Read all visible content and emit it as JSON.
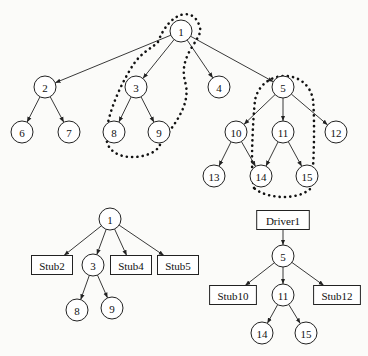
{
  "diagram": {
    "top_tree": {
      "nodes": [
        {
          "id": "1",
          "label": "1",
          "x": 181,
          "y": 31
        },
        {
          "id": "2",
          "label": "2",
          "x": 45,
          "y": 87
        },
        {
          "id": "3",
          "label": "3",
          "x": 136,
          "y": 87
        },
        {
          "id": "4",
          "label": "4",
          "x": 219,
          "y": 87
        },
        {
          "id": "5",
          "label": "5",
          "x": 283,
          "y": 87
        },
        {
          "id": "6",
          "label": "6",
          "x": 22,
          "y": 132
        },
        {
          "id": "7",
          "label": "7",
          "x": 69,
          "y": 132
        },
        {
          "id": "8",
          "label": "8",
          "x": 114,
          "y": 132
        },
        {
          "id": "9",
          "label": "9",
          "x": 159,
          "y": 132
        },
        {
          "id": "10",
          "label": "10",
          "x": 236,
          "y": 132
        },
        {
          "id": "11",
          "label": "11",
          "x": 283,
          "y": 132
        },
        {
          "id": "12",
          "label": "12",
          "x": 336,
          "y": 132
        },
        {
          "id": "13",
          "label": "13",
          "x": 214,
          "y": 176
        },
        {
          "id": "14",
          "label": "14",
          "x": 261,
          "y": 176
        },
        {
          "id": "15",
          "label": "15",
          "x": 307,
          "y": 176
        }
      ],
      "edges": [
        [
          "1",
          "2"
        ],
        [
          "1",
          "3"
        ],
        [
          "1",
          "4"
        ],
        [
          "1",
          "5"
        ],
        [
          "2",
          "6"
        ],
        [
          "2",
          "7"
        ],
        [
          "3",
          "8"
        ],
        [
          "3",
          "9"
        ],
        [
          "5",
          "10"
        ],
        [
          "5",
          "11"
        ],
        [
          "5",
          "12"
        ],
        [
          "10",
          "13"
        ],
        [
          "10",
          "14"
        ],
        [
          "11",
          "14"
        ],
        [
          "11",
          "15"
        ]
      ],
      "dotted_groups": [
        {
          "name": "group-1-3-8-9",
          "members": [
            "1",
            "3",
            "8",
            "9"
          ]
        },
        {
          "name": "group-5-11-14-15",
          "members": [
            "5",
            "11",
            "14",
            "15"
          ]
        }
      ]
    },
    "left_subtree": {
      "nodes": [
        {
          "id": "1",
          "label": "1",
          "shape": "circle",
          "x": 110,
          "y": 219
        },
        {
          "id": "stub2",
          "label": "Stub2",
          "shape": "box",
          "x": 52,
          "y": 265
        },
        {
          "id": "3",
          "label": "3",
          "shape": "circle",
          "x": 93,
          "y": 265
        },
        {
          "id": "stub4",
          "label": "Stub4",
          "shape": "box",
          "x": 131,
          "y": 265
        },
        {
          "id": "stub5",
          "label": "Stub5",
          "shape": "box",
          "x": 178,
          "y": 265
        },
        {
          "id": "8",
          "label": "8",
          "shape": "circle",
          "x": 77,
          "y": 310
        },
        {
          "id": "9",
          "label": "9",
          "shape": "circle",
          "x": 112,
          "y": 308
        }
      ],
      "edges": [
        [
          "1",
          "stub2"
        ],
        [
          "1",
          "3"
        ],
        [
          "1",
          "stub4"
        ],
        [
          "1",
          "stub5"
        ],
        [
          "3",
          "8"
        ],
        [
          "3",
          "9"
        ]
      ]
    },
    "right_subtree": {
      "nodes": [
        {
          "id": "driver1",
          "label": "Driver1",
          "shape": "box",
          "x": 283,
          "y": 220
        },
        {
          "id": "5",
          "label": "5",
          "shape": "circle",
          "x": 283,
          "y": 256
        },
        {
          "id": "stub10",
          "label": "Stub10",
          "shape": "box",
          "x": 233,
          "y": 295
        },
        {
          "id": "11",
          "label": "11",
          "shape": "circle",
          "x": 283,
          "y": 295
        },
        {
          "id": "stub12",
          "label": "Stub12",
          "shape": "box",
          "x": 337,
          "y": 295
        },
        {
          "id": "14",
          "label": "14",
          "shape": "circle",
          "x": 262,
          "y": 333
        },
        {
          "id": "15",
          "label": "15",
          "shape": "circle",
          "x": 306,
          "y": 333
        }
      ],
      "edges": [
        [
          "driver1",
          "5"
        ],
        [
          "5",
          "stub10"
        ],
        [
          "5",
          "11"
        ],
        [
          "5",
          "stub12"
        ],
        [
          "11",
          "14"
        ],
        [
          "11",
          "15"
        ]
      ]
    }
  }
}
